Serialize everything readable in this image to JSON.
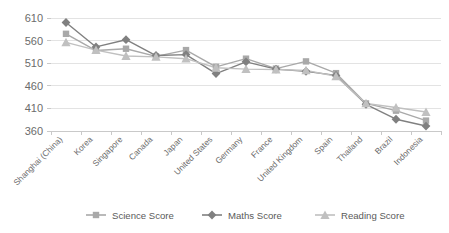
{
  "chart_data": {
    "type": "line",
    "title": "",
    "subtitle": "",
    "xlabel": "",
    "ylabel": "",
    "ylim": [
      360,
      610
    ],
    "yticks": [
      360,
      410,
      460,
      510,
      560,
      610
    ],
    "ytick_labels": [
      "360",
      "410",
      "460",
      "510",
      "560",
      "610"
    ],
    "grid": true,
    "legend_position": "bottom",
    "categories": [
      "Shanghai (China)",
      "Korea",
      "Singapore",
      "Canada",
      "Japan",
      "United States",
      "Germany",
      "France",
      "United Kingdom",
      "Spain",
      "Thailand",
      "Brazil",
      "Indonesia"
    ],
    "series": [
      {
        "name": "Science Score",
        "marker": "square",
        "color": "#a9a9a9",
        "values": [
          575,
          538,
          542,
          525,
          539,
          502,
          520,
          498,
          514,
          488,
          421,
          405,
          383
        ]
      },
      {
        "name": "Maths Score",
        "marker": "diamond",
        "color": "#808080",
        "values": [
          600,
          546,
          562,
          527,
          529,
          487,
          513,
          497,
          492,
          483,
          419,
          386,
          371
        ]
      },
      {
        "name": "Reading Score",
        "marker": "triangle",
        "color": "#c0c0c0",
        "values": [
          556,
          539,
          526,
          524,
          520,
          500,
          497,
          496,
          494,
          481,
          421,
          412,
          402
        ]
      }
    ]
  },
  "legend": {
    "items": [
      {
        "label": "Science Score"
      },
      {
        "label": "Maths Score"
      },
      {
        "label": "Reading Score"
      }
    ]
  }
}
